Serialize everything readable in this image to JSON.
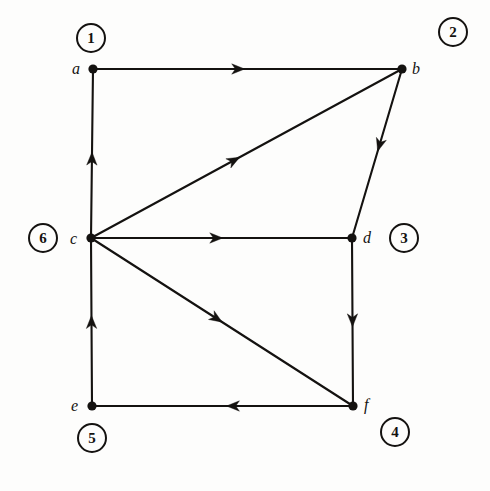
{
  "figure": {
    "type": "directed-graph",
    "background_color": "#fdfdfc",
    "ink_color": "#141210",
    "width": 490,
    "height": 491
  },
  "nodes": [
    {
      "id": "a",
      "label": "a",
      "x": 93,
      "y": 69,
      "label_x": 72,
      "label_y": 61
    },
    {
      "id": "b",
      "label": "b",
      "x": 402,
      "y": 69,
      "label_x": 412,
      "label_y": 61
    },
    {
      "id": "c",
      "label": "c",
      "x": 91,
      "y": 238,
      "label_x": 70,
      "label_y": 231
    },
    {
      "id": "d",
      "label": "d",
      "x": 352,
      "y": 238,
      "label_x": 363,
      "label_y": 230
    },
    {
      "id": "e",
      "label": "e",
      "x": 92,
      "y": 406,
      "label_x": 71,
      "label_y": 398
    },
    {
      "id": "f",
      "label": "f",
      "x": 353,
      "y": 406,
      "label_x": 364,
      "label_y": 397
    }
  ],
  "order_badges": [
    {
      "number": "1",
      "for_node": "a",
      "x": 76,
      "y": 23
    },
    {
      "number": "2",
      "for_node": "b",
      "x": 438,
      "y": 17
    },
    {
      "number": "3",
      "for_node": "d",
      "x": 389,
      "y": 223
    },
    {
      "number": "4",
      "for_node": "f",
      "x": 380,
      "y": 417
    },
    {
      "number": "5",
      "for_node": "e",
      "x": 77,
      "y": 423
    },
    {
      "number": "6",
      "for_node": "c",
      "x": 28,
      "y": 223
    }
  ],
  "edges": [
    {
      "id": "a-b",
      "from": "a",
      "to": "b",
      "x1": 93,
      "y1": 69,
      "x2": 402,
      "y2": 69,
      "arrow_t": 0.47,
      "direction": "right"
    },
    {
      "id": "c-a",
      "from": "c",
      "to": "a",
      "x1": 91,
      "y1": 238,
      "x2": 93,
      "y2": 69,
      "arrow_t": 0.47,
      "direction": "up"
    },
    {
      "id": "c-b",
      "from": "c",
      "to": "b",
      "x1": 91,
      "y1": 238,
      "x2": 402,
      "y2": 69,
      "arrow_t": 0.46,
      "direction": "up-right"
    },
    {
      "id": "b-d",
      "from": "b",
      "to": "d",
      "x1": 402,
      "y1": 69,
      "x2": 352,
      "y2": 238,
      "arrow_t": 0.45,
      "direction": "down-left"
    },
    {
      "id": "c-d",
      "from": "c",
      "to": "d",
      "x1": 91,
      "y1": 238,
      "x2": 352,
      "y2": 238,
      "arrow_t": 0.48,
      "direction": "right"
    },
    {
      "id": "d-f",
      "from": "d",
      "to": "f",
      "x1": 352,
      "y1": 238,
      "x2": 353,
      "y2": 406,
      "arrow_t": 0.49,
      "direction": "down"
    },
    {
      "id": "c-f",
      "from": "c",
      "to": "f",
      "x1": 91,
      "y1": 238,
      "x2": 353,
      "y2": 406,
      "arrow_t": 0.48,
      "direction": "down-right"
    },
    {
      "id": "f-e",
      "from": "f",
      "to": "e",
      "x1": 353,
      "y1": 406,
      "x2": 92,
      "y2": 406,
      "arrow_t": 0.46,
      "direction": "left"
    },
    {
      "id": "e-c",
      "from": "e",
      "to": "c",
      "x1": 92,
      "y1": 406,
      "x2": 91,
      "y2": 238,
      "arrow_t": 0.5,
      "direction": "up"
    }
  ]
}
